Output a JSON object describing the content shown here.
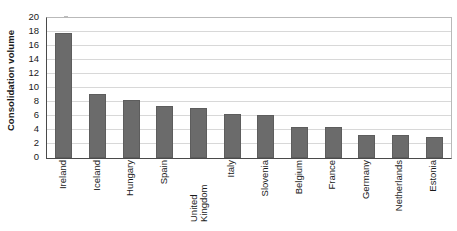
{
  "chart_data": {
    "type": "bar",
    "title": "",
    "subtitle": "",
    "xlabel": "",
    "ylabel": "Consolidation volume",
    "ylim": [
      0,
      20
    ],
    "yticks": [
      0,
      2,
      4,
      6,
      8,
      10,
      12,
      14,
      16,
      18,
      20
    ],
    "ytick_labels": [
      "0",
      "2",
      "4",
      "6",
      "8",
      "10",
      "12",
      "14",
      "16",
      "18",
      "20"
    ],
    "grid": true,
    "legend": false,
    "legend_position": "none",
    "orientation": "vertical",
    "bar_color": "#6b6b6b",
    "categories": [
      "Ireland",
      "Iceland",
      "Hungary",
      "Spain",
      "United Kingdom",
      "Italy",
      "Slovenia",
      "Belgium",
      "France",
      "Germany",
      "Netherlands",
      "Estonia"
    ],
    "values": [
      17.9,
      9.1,
      8.25,
      7.4,
      7.2,
      6.25,
      6.15,
      4.5,
      4.45,
      3.3,
      3.25,
      3.0
    ],
    "annotations": []
  },
  "axis": {
    "y_title": "Consolidation volume"
  }
}
